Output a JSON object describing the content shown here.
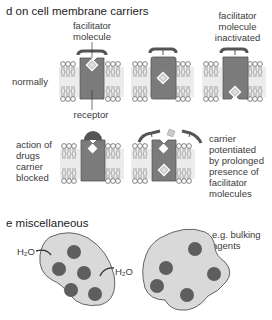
{
  "section_d": {
    "title": "d  on cell membrane carriers",
    "row_labels": {
      "normally": "normally",
      "drugs": [
        "action of",
        "drugs",
        "carrier",
        "blocked"
      ]
    },
    "labels": {
      "facilitator_molecule": [
        "facilitator",
        "molecule"
      ],
      "facilitator_inactivated": [
        "facilitator",
        "molecule",
        "inactivated"
      ],
      "receptor": "receptor",
      "potentiated": [
        "carrier",
        "potentiated",
        "by prolonged",
        "presence of",
        "facilitator",
        "molecules"
      ]
    }
  },
  "section_e": {
    "title": "e  miscellaneous",
    "labels": {
      "water_left_1": "H₂O",
      "water_left_2": "H₂O",
      "water_right": "H₂O",
      "bulking": [
        "e.g. bulking",
        "agents"
      ]
    }
  },
  "colors": {
    "carrier": "#7b7b7b",
    "carrier_dark": "#555555",
    "cell_fill": "#d9d9d9",
    "particle": "#5e5e5e",
    "membrane_band": "#ececec",
    "diamond": "#c8c8c8"
  }
}
